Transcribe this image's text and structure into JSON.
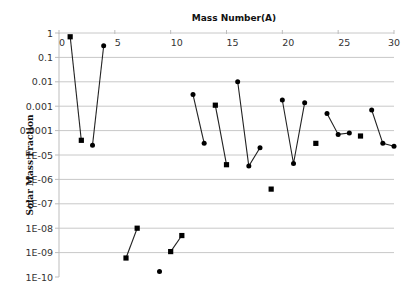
{
  "chart_data": {
    "type": "scatter",
    "title": "Mass Number(A)",
    "xlabel": "Mass Number(A)",
    "ylabel": "Solar Mass Fraction",
    "xlim": [
      0,
      30
    ],
    "x_ticks": [
      0,
      5,
      10,
      15,
      20,
      25,
      30
    ],
    "y_scale": "log",
    "ylim": [
      1e-10,
      1
    ],
    "y_ticks": [
      {
        "value": 1,
        "label": "1"
      },
      {
        "value": 0.1,
        "label": "0.1"
      },
      {
        "value": 0.01,
        "label": "0.01"
      },
      {
        "value": 0.001,
        "label": "0.001"
      },
      {
        "value": 0.0001,
        "label": "0.0001"
      },
      {
        "value": 1e-05,
        "label": "1E-05"
      },
      {
        "value": 1e-06,
        "label": "1E-06"
      },
      {
        "value": 1e-07,
        "label": "1E-07"
      },
      {
        "value": 1e-08,
        "label": "1E-08"
      },
      {
        "value": 1e-09,
        "label": "1E-09"
      },
      {
        "value": 1e-10,
        "label": "1E-10"
      }
    ],
    "x_axis_position": "top",
    "grid": "horizontal",
    "legend": "none",
    "points": [
      {
        "A": 1,
        "y": 0.7,
        "marker": "square"
      },
      {
        "A": 2,
        "y": 4e-05,
        "marker": "square"
      },
      {
        "A": 3,
        "y": 2.5e-05,
        "marker": "circle"
      },
      {
        "A": 4,
        "y": 0.3,
        "marker": "circle"
      },
      {
        "A": 6,
        "y": 6e-10,
        "marker": "square"
      },
      {
        "A": 7,
        "y": 1e-08,
        "marker": "square"
      },
      {
        "A": 9,
        "y": 1.7e-10,
        "marker": "circle"
      },
      {
        "A": 10,
        "y": 1.1e-09,
        "marker": "square"
      },
      {
        "A": 11,
        "y": 5e-09,
        "marker": "square"
      },
      {
        "A": 12,
        "y": 0.003,
        "marker": "circle"
      },
      {
        "A": 13,
        "y": 3e-05,
        "marker": "circle"
      },
      {
        "A": 14,
        "y": 0.0011,
        "marker": "square"
      },
      {
        "A": 15,
        "y": 4e-06,
        "marker": "square"
      },
      {
        "A": 16,
        "y": 0.01,
        "marker": "circle"
      },
      {
        "A": 17,
        "y": 3.5e-06,
        "marker": "circle"
      },
      {
        "A": 18,
        "y": 2e-05,
        "marker": "circle"
      },
      {
        "A": 19,
        "y": 4e-07,
        "marker": "square"
      },
      {
        "A": 20,
        "y": 0.0018,
        "marker": "circle"
      },
      {
        "A": 21,
        "y": 4.5e-06,
        "marker": "circle"
      },
      {
        "A": 22,
        "y": 0.0014,
        "marker": "circle"
      },
      {
        "A": 23,
        "y": 3e-05,
        "marker": "square"
      },
      {
        "A": 24,
        "y": 0.0005,
        "marker": "circle"
      },
      {
        "A": 25,
        "y": 7e-05,
        "marker": "circle"
      },
      {
        "A": 26,
        "y": 8e-05,
        "marker": "circle"
      },
      {
        "A": 27,
        "y": 6e-05,
        "marker": "square"
      },
      {
        "A": 28,
        "y": 0.0007,
        "marker": "circle"
      },
      {
        "A": 29,
        "y": 3e-05,
        "marker": "circle"
      },
      {
        "A": 30,
        "y": 2.3e-05,
        "marker": "circle"
      }
    ],
    "segments": [
      [
        1,
        2
      ],
      [
        3,
        4
      ],
      [
        6,
        7
      ],
      [
        10,
        11
      ],
      [
        12,
        13
      ],
      [
        14,
        15
      ],
      [
        16,
        17,
        18
      ],
      [
        20,
        21,
        22
      ],
      [
        24,
        25,
        26
      ],
      [
        28,
        29,
        30
      ]
    ]
  }
}
